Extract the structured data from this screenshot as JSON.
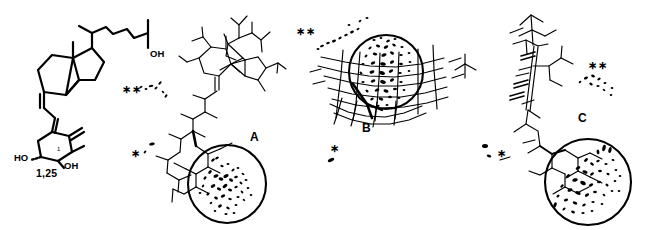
{
  "figure": {
    "background_color": "#ffffff",
    "stroke_color": "#000000",
    "width": 651,
    "height": 230
  },
  "structure_1_25": {
    "name_label": "1,25",
    "hydroxyl_left_label": "HO",
    "hydroxyl_ring_label": "OH",
    "hydroxyl_chain_label": "OH",
    "ring_position_label": "1"
  },
  "panels": [
    {
      "letter": "A",
      "x": 250,
      "y": 131
    },
    {
      "letter": "B",
      "x": 362,
      "y": 122
    },
    {
      "letter": "C",
      "x": 578,
      "y": 112
    }
  ],
  "star_marks": [
    {
      "glyph": "∗∗",
      "x": 122,
      "y": 84,
      "size": 11
    },
    {
      "glyph": "∗",
      "x": 131,
      "y": 148,
      "size": 11
    },
    {
      "glyph": "∗∗",
      "x": 296,
      "y": 26,
      "size": 11
    },
    {
      "glyph": "∗",
      "x": 330,
      "y": 143,
      "size": 11
    },
    {
      "glyph": "∗∗",
      "x": 588,
      "y": 60,
      "size": 11
    },
    {
      "glyph": "∗",
      "x": 497,
      "y": 148,
      "size": 11
    }
  ],
  "annotations": {
    "panel_a_label": "A",
    "panel_b_label": "B",
    "panel_c_label": "C"
  }
}
